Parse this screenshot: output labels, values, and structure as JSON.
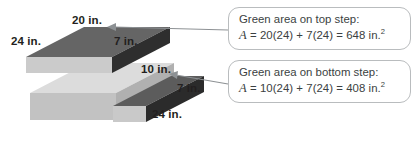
{
  "figure": {
    "blocks": [
      {
        "id": "top-step",
        "name": "top-step-block",
        "labels": {
          "length": "20 in.",
          "depth": "24 in.",
          "height": "7 in."
        },
        "colors": {
          "top": "#6b6b6b",
          "side": "#2f2f2f",
          "front": "#cfcfcf"
        }
      },
      {
        "id": "base-slab",
        "name": "base-slab-block",
        "labels": {},
        "colors": {
          "top": "#d6d6d6",
          "side": "#c0c0c0",
          "front": "#b7b7b7"
        }
      },
      {
        "id": "bottom-step",
        "name": "bottom-step-block",
        "labels": {
          "length": "10 in.",
          "depth": "24 in.",
          "height": "7 in."
        },
        "colors": {
          "top": "#5f5f5f",
          "side": "#2b2b2b",
          "front": "#cccccc"
        }
      }
    ],
    "dimension_labels": [
      {
        "key": "top_length",
        "text": "20 in.",
        "x": 72,
        "y": 16
      },
      {
        "key": "top_depth",
        "text": "24 in.",
        "x": 11,
        "y": 36
      },
      {
        "key": "top_height",
        "text": "7 in.",
        "x": 115,
        "y": 36
      },
      {
        "key": "bottom_length",
        "text": "10 in.",
        "x": 141,
        "y": 70
      },
      {
        "key": "bottom_height",
        "text": "7 in.",
        "x": 177,
        "y": 84
      },
      {
        "key": "bottom_depth",
        "text": "24 in.",
        "x": 152,
        "y": 110
      }
    ],
    "callouts": [
      {
        "id": "callout-top",
        "heading": "Green area on top step:",
        "formula": {
          "variable": "A",
          "equals": "=",
          "expression": "20(24) + 7(24) = 648 in.",
          "exponent": "2",
          "plain": "A = 20(24) + 7(24) = 648 in.2"
        },
        "box": {
          "x": 228,
          "y": 7,
          "width": 183,
          "height": 43
        },
        "arrow": {
          "from_x": 228,
          "from_y": 30,
          "to_x": 110,
          "to_y": 27
        }
      },
      {
        "id": "callout-bottom",
        "heading": "Green area on bottom step:",
        "formula": {
          "variable": "A",
          "equals": "=",
          "expression": "10(24) + 7(24) = 408 in.",
          "exponent": "2",
          "plain": "A = 10(24) + 7(24) = 408 in.2"
        },
        "box": {
          "x": 228,
          "y": 60,
          "width": 183,
          "height": 43
        },
        "arrow": {
          "from_x": 228,
          "from_y": 84,
          "to_x": 172,
          "to_y": 75
        }
      }
    ],
    "colors": {
      "text": "#231f20",
      "callout_text": "#3b3f42",
      "callout_border": "#b9bcbe",
      "arrow": "#8d9194",
      "background": "#ffffff"
    }
  }
}
